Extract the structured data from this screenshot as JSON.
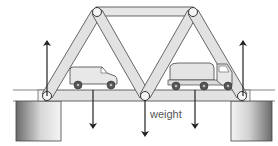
{
  "diagram": {
    "type": "truss-bridge-force-diagram",
    "labels": {
      "weight": "weight"
    },
    "vehicles": [
      {
        "name": "van",
        "position": "left-span"
      },
      {
        "name": "truck",
        "position": "right-span"
      }
    ],
    "forces": [
      {
        "name": "left-support-reaction",
        "direction": "up"
      },
      {
        "name": "right-support-reaction",
        "direction": "up"
      },
      {
        "name": "van-load",
        "direction": "down"
      },
      {
        "name": "center-weight",
        "direction": "down",
        "label": "weight"
      },
      {
        "name": "truck-load",
        "direction": "down"
      }
    ],
    "supports": [
      "left-pillar",
      "right-pillar"
    ],
    "colors": {
      "member_fill": "#e2e2e2",
      "member_stroke": "#444444",
      "arrow": "#222222",
      "pillar_dark": "#6a6a6a",
      "pillar_light": "#f2f2f2",
      "vehicle_fill": "#e6e6e6",
      "wheel": "#555555"
    }
  }
}
